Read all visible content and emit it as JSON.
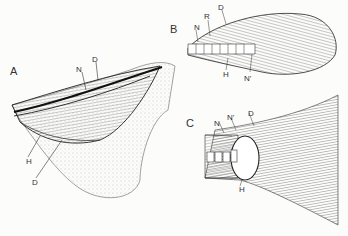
{
  "figure": {
    "panels": [
      {
        "id": "A",
        "label": "A",
        "description": "Heterocercal tail, lateral view",
        "annotations": [
          "N",
          "D",
          "H",
          "D"
        ]
      },
      {
        "id": "B",
        "label": "B",
        "description": "Abbreviated heterocercal tail",
        "annotations": [
          "N",
          "R",
          "D",
          "H",
          "N'"
        ]
      },
      {
        "id": "C",
        "label": "C",
        "description": "Homocercal tail",
        "annotations": [
          "N",
          "N'",
          "D",
          "H"
        ]
      }
    ],
    "colors": {
      "ink": "#2a2a2a",
      "paper": "#fcfcfb",
      "stipple": "#8a8a8a"
    }
  }
}
